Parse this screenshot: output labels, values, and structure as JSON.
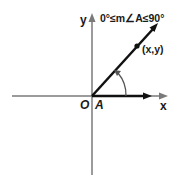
{
  "diagram": {
    "title": "0°≤m∠A≤90°",
    "labels": {
      "y_axis": "y",
      "x_axis": "x",
      "origin": "O",
      "angle": "A",
      "point": "(x,y)"
    },
    "colors": {
      "axis": "#7a7a7a",
      "ray": "#111111",
      "arc": "#555555",
      "text": "#1a1a1a"
    }
  }
}
